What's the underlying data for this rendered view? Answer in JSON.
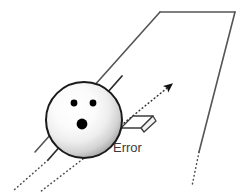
{
  "figure": {
    "kind": "bowling-lane-trajectory-diagram",
    "background_color": "#ffffff",
    "width": 241,
    "height": 194
  },
  "labels": {
    "error_label": "Error"
  },
  "colors": {
    "lane_outline": "#555555",
    "ball_outline": "#1a1a1a",
    "ball_highlight": "#ffffff",
    "ball_shade": "#9a9a9a",
    "finger_hole": "#000000",
    "path_line": "#2b2b2b",
    "dotted_line": "#4a4a4a",
    "arrow": "#111111",
    "error_marker_fill": "#ffffff",
    "error_marker_stroke": "#3c3c3c",
    "label_text": "#3a3a3a"
  },
  "elements": {
    "lane": {
      "name": "bowling-lane",
      "description": "open parallelogram outline of the lane receding to upper right",
      "top_left": [
        160,
        12
      ],
      "top_right": [
        235,
        12
      ],
      "left_edge_end": [
        35,
        152
      ],
      "right_edge_end": [
        199,
        152
      ],
      "right_edge_dotted_end": [
        192,
        186
      ]
    },
    "ball": {
      "name": "bowling-ball",
      "center": [
        84,
        120
      ],
      "radius": 38,
      "finger_holes": [
        {
          "name": "hole-left-top",
          "cx": 74,
          "cy": 103,
          "r": 3.4
        },
        {
          "name": "hole-right-top",
          "cx": 93,
          "cy": 103,
          "r": 3.4
        },
        {
          "name": "hole-thumb",
          "cx": 82,
          "cy": 124,
          "r": 5.4
        }
      ]
    },
    "actual_path": {
      "name": "actual-ball-path",
      "description": "solid-to-dotted line through the ball along the lane direction",
      "solid_from": [
        122,
        76
      ],
      "solid_to": [
        48,
        160
      ],
      "dotted_to": [
        14,
        190
      ]
    },
    "second_dotted_path": {
      "name": "secondary-path-line",
      "description": "parallel dotted guide line below the ball",
      "from": [
        118,
        130
      ],
      "to": [
        40,
        192
      ]
    },
    "intended_path_arrow": {
      "name": "intended-path-arrow",
      "description": "dotted arrow pointing up-right showing intended direction",
      "tail": [
        118,
        128
      ],
      "tip": [
        177,
        80
      ],
      "style": "dotted",
      "head": "filled-triangle"
    },
    "error_marker": {
      "name": "error-marker",
      "description": "small 3d parallelogram plate attached at ball right side marking the deviation",
      "outline_points": "122,127 133,116 152,116 141,127",
      "tab_points": "141,127 152,116 155,120 144,131"
    }
  },
  "annotations": [
    {
      "name": "error-label",
      "text": "Error",
      "x": 113,
      "y": 152,
      "anchor": "start"
    }
  ]
}
